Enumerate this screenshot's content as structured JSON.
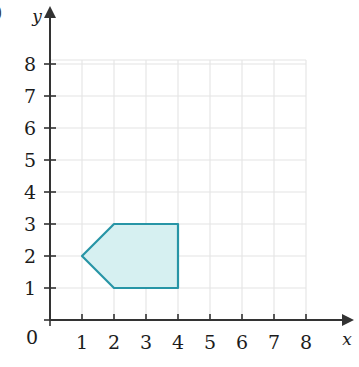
{
  "figure": {
    "corner_mark": ")",
    "background_color": "#ffffff"
  },
  "axes": {
    "x_name": "x",
    "y_name": "y",
    "origin_label": "0",
    "x_ticks": [
      "1",
      "2",
      "3",
      "4",
      "5",
      "6",
      "7",
      "8"
    ],
    "y_ticks": [
      "1",
      "2",
      "3",
      "4",
      "5",
      "6",
      "7",
      "8"
    ],
    "axis_color": "#333333",
    "grid_color": "#e3e3e3"
  },
  "chart_data": {
    "type": "scatter",
    "title": "",
    "xlabel": "x",
    "ylabel": "y",
    "xlim": [
      0,
      8
    ],
    "ylim": [
      0,
      8
    ],
    "xticks": [
      0,
      1,
      2,
      3,
      4,
      5,
      6,
      7,
      8
    ],
    "yticks": [
      0,
      1,
      2,
      3,
      4,
      5,
      6,
      7,
      8
    ],
    "grid": true,
    "legend": "none",
    "shapes": [
      {
        "name": "pentagon",
        "kind": "polygon",
        "vertices": [
          [
            1,
            2
          ],
          [
            2,
            3
          ],
          [
            4,
            3
          ],
          [
            4,
            1
          ],
          [
            2,
            1
          ]
        ],
        "fill": "#d6f0f1",
        "stroke": "#2795a6",
        "stroke_width": 2.2
      }
    ]
  }
}
